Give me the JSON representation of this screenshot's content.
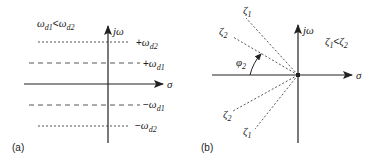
{
  "panel_a": {
    "caption": "(a)",
    "condition": {
      "lhs": "ω",
      "lhs_sub": "d1",
      "op": "<",
      "rhs": "ω",
      "rhs_sub": "d2"
    },
    "axes": {
      "x_label": "σ",
      "y_label": "jω"
    },
    "lines": [
      {
        "name": "+ωd2",
        "sign": "+",
        "sym": "ω",
        "sub": "d2",
        "style": "dotted"
      },
      {
        "name": "+ωd1",
        "sign": "+",
        "sym": "ω",
        "sub": "d1",
        "style": "dashed"
      },
      {
        "name": "-ωd1",
        "sign": "−",
        "sym": "ω",
        "sub": "d1",
        "style": "dashed"
      },
      {
        "name": "-ωd2",
        "sign": "−",
        "sym": "ω",
        "sub": "d2",
        "style": "dotted"
      }
    ]
  },
  "panel_b": {
    "caption": "(b)",
    "condition": {
      "lhs": "ζ",
      "lhs_sub": "1",
      "op": "<",
      "rhs": "ζ",
      "rhs_sub": "2"
    },
    "axes": {
      "x_label": "σ",
      "y_label": "jω"
    },
    "angle_label": {
      "sym": "φ",
      "sub": "2"
    },
    "rays": [
      {
        "sym": "ζ",
        "sub": "1",
        "position": "upper"
      },
      {
        "sym": "ζ",
        "sub": "2",
        "position": "upper"
      },
      {
        "sym": "ζ",
        "sub": "2",
        "position": "lower"
      },
      {
        "sym": "ζ",
        "sub": "1",
        "position": "lower"
      }
    ]
  }
}
